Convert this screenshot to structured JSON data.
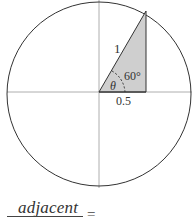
{
  "diagram": {
    "type": "unit-circle-triangle",
    "labels": {
      "hypotenuse": "1",
      "angle_value": "60°",
      "angle_symbol": "θ",
      "adjacent_length": "0.5"
    },
    "formula": {
      "numerator": "adjacent",
      "equals": "="
    },
    "colors": {
      "triangle_fill": "#cfcfcf",
      "stroke": "#333333",
      "axis": "#999999"
    }
  }
}
